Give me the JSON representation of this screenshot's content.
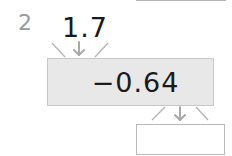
{
  "question": {
    "number": "2",
    "input_value": "1.7",
    "operation": "−0.64",
    "answer": ""
  },
  "colors": {
    "box_fill": "#e8e8e8",
    "arrow": "#a8a8a8",
    "text": "#1a1a1a",
    "number_label": "#9a9a9a"
  }
}
